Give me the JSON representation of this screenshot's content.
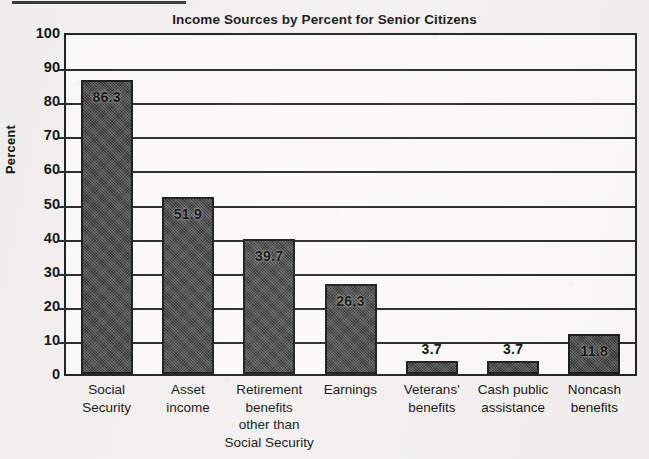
{
  "chart_data": {
    "type": "bar",
    "title": "Income Sources by Percent for Senior Citizens",
    "xlabel": "",
    "ylabel": "Percent",
    "ylim": [
      0,
      100
    ],
    "ytick_step": 10,
    "yticks": [
      "100",
      "90",
      "80",
      "70",
      "60",
      "50",
      "40",
      "30",
      "20",
      "10",
      "0"
    ],
    "grid": true,
    "legend": "none",
    "categories": [
      "Social Security",
      "Asset income",
      "Retirement benefits other than Social Security",
      "Earnings",
      "Veterans' benefits",
      "Cash public assistance",
      "Noncash benefits"
    ],
    "category_lines": [
      [
        "Social",
        "Security"
      ],
      [
        "Asset",
        "income"
      ],
      [
        "Retirement",
        "benefits",
        "other than",
        "Social Security"
      ],
      [
        "Earnings"
      ],
      [
        "Veterans'",
        "benefits"
      ],
      [
        "Cash public",
        "assistance"
      ],
      [
        "Noncash",
        "benefits"
      ]
    ],
    "values": [
      86.3,
      51.9,
      39.7,
      26.3,
      3.7,
      3.7,
      11.8
    ],
    "value_labels": [
      "86.3",
      "51.9",
      "39.7",
      "26.3",
      "3.7",
      "3.7",
      "11.8"
    ],
    "label_placement": [
      "inside",
      "inside",
      "inside",
      "inside",
      "outside",
      "outside",
      "inside"
    ],
    "bar_color": "#4a4a4a",
    "bar_border_color": "#1c1c1c",
    "axis_color": "#222222",
    "background_color": "#f2f1ef"
  }
}
